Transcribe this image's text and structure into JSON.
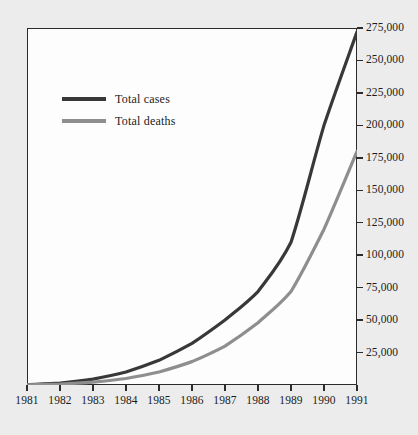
{
  "chart_data": {
    "type": "line",
    "title": "",
    "xlabel": "",
    "ylabel": "",
    "grid": false,
    "legend_position": "top-left",
    "x": [
      1981,
      1982,
      1983,
      1984,
      1985,
      1986,
      1987,
      1988,
      1989,
      1990,
      1991
    ],
    "categories": [
      "1981",
      "1982",
      "1983",
      "1984",
      "1985",
      "1986",
      "1987",
      "1988",
      "1989",
      "1990",
      "1991"
    ],
    "xlim": [
      1981,
      1991
    ],
    "ylim": [
      0,
      275000
    ],
    "ytick_values": [
      25000,
      50000,
      75000,
      100000,
      125000,
      150000,
      175000,
      200000,
      225000,
      250000,
      275000
    ],
    "ytick_labels": [
      "25,000",
      "50,000",
      "75,000",
      "100,000",
      "125,000",
      "150,000",
      "175,000",
      "200,000",
      "225,000",
      "250,000",
      "275,000"
    ],
    "series": [
      {
        "name": "Total cases",
        "color": "#383838",
        "values": [
          300,
          1500,
          4500,
          10000,
          19000,
          32000,
          50000,
          72000,
          110000,
          200000,
          272000
        ]
      },
      {
        "name": "Total deaths",
        "color": "#8e8e8e",
        "values": [
          150,
          700,
          2200,
          5000,
          10000,
          18000,
          30000,
          48000,
          72000,
          120000,
          180000
        ]
      }
    ]
  },
  "legend": {
    "items": [
      {
        "label": "Total cases",
        "color": "#383838"
      },
      {
        "label": "Total deaths",
        "color": "#8e8e8e"
      }
    ]
  }
}
